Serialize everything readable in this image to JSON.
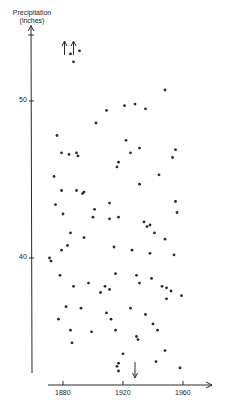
{
  "chart_data": {
    "type": "scatter",
    "title": "",
    "xlabel": "",
    "ylabel": "Precipitation (inches)",
    "ylabel_line1": "Precipitation",
    "ylabel_line2": "(inches)",
    "xlim": [
      1868,
      1988
    ],
    "ylim": [
      32,
      59
    ],
    "x_ticks": [
      1880,
      1920,
      1960
    ],
    "x_tick_labels": [
      "1880",
      "1920",
      "1960"
    ],
    "y_ticks": [
      40,
      50
    ],
    "y_tick_labels": [
      "40",
      "50"
    ],
    "grid": false,
    "legend": null,
    "annotations": [
      {
        "type": "arrow-up",
        "x": 1881,
        "note": "off-scale high value"
      },
      {
        "type": "arrow-up",
        "x": 1887,
        "note": "off-scale high value"
      },
      {
        "type": "arrow-down",
        "x": 1928,
        "note": "off-scale low value"
      }
    ],
    "points": [
      [
        1885,
        53.0
      ],
      [
        1891,
        53.2
      ],
      [
        1887,
        52.5
      ],
      [
        1876,
        47.8
      ],
      [
        1879,
        46.7
      ],
      [
        1884,
        46.6
      ],
      [
        1889,
        46.7
      ],
      [
        1890,
        46.5
      ],
      [
        1874,
        45.2
      ],
      [
        1879,
        44.3
      ],
      [
        1889,
        44.3
      ],
      [
        1893,
        44.1
      ],
      [
        1894,
        44.2
      ],
      [
        1875,
        43.4
      ],
      [
        1880,
        42.8
      ],
      [
        1901,
        43.1
      ],
      [
        1911,
        43.5
      ],
      [
        1900,
        42.6
      ],
      [
        1911,
        42.5
      ],
      [
        1917,
        42.6
      ],
      [
        1885,
        41.6
      ],
      [
        1894,
        41.3
      ],
      [
        1879,
        40.5
      ],
      [
        1883,
        40.8
      ],
      [
        1871,
        40.0
      ],
      [
        1872,
        39.8
      ],
      [
        1878,
        38.9
      ],
      [
        1897,
        38.4
      ],
      [
        1887,
        38.2
      ],
      [
        1908,
        38.2
      ],
      [
        1911,
        38.0
      ],
      [
        1905,
        37.8
      ],
      [
        1882,
        36.9
      ],
      [
        1892,
        36.8
      ],
      [
        1877,
        36.1
      ],
      [
        1885,
        35.4
      ],
      [
        1899,
        35.3
      ],
      [
        1886,
        34.6
      ],
      [
        1909,
        36.5
      ],
      [
        1912,
        36.1
      ],
      [
        1915,
        35.4
      ],
      [
        1902,
        48.6
      ],
      [
        1909,
        49.4
      ],
      [
        1921,
        49.7
      ],
      [
        1928,
        49.8
      ],
      [
        1948,
        50.7
      ],
      [
        1935,
        49.5
      ],
      [
        1922,
        47.5
      ],
      [
        1925,
        46.7
      ],
      [
        1931,
        47.0
      ],
      [
        1955,
        46.9
      ],
      [
        1953,
        46.4
      ],
      [
        1917,
        46.1
      ],
      [
        1916,
        45.8
      ],
      [
        1931,
        44.7
      ],
      [
        1944,
        45.3
      ],
      [
        1934,
        42.3
      ],
      [
        1938,
        42.1
      ],
      [
        1936,
        42.0
      ],
      [
        1941,
        41.6
      ],
      [
        1948,
        41.2
      ],
      [
        1914,
        40.7
      ],
      [
        1926,
        40.5
      ],
      [
        1938,
        40.3
      ],
      [
        1954,
        40.2
      ],
      [
        1956,
        42.9
      ],
      [
        1955,
        43.6
      ],
      [
        1915,
        39.0
      ],
      [
        1929,
        38.9
      ],
      [
        1939,
        38.7
      ],
      [
        1946,
        38.2
      ],
      [
        1949,
        38.1
      ],
      [
        1952,
        37.9
      ],
      [
        1931,
        38.4
      ],
      [
        1949,
        37.4
      ],
      [
        1959,
        37.6
      ],
      [
        1925,
        36.8
      ],
      [
        1935,
        36.4
      ],
      [
        1940,
        35.8
      ],
      [
        1929,
        35.0
      ],
      [
        1930,
        34.8
      ],
      [
        1943,
        35.4
      ],
      [
        1948,
        34.1
      ],
      [
        1920,
        33.9
      ],
      [
        1916,
        33.1
      ],
      [
        1917,
        33.3
      ],
      [
        1917,
        32.8
      ],
      [
        1942,
        33.4
      ],
      [
        1958,
        33.0
      ]
    ]
  },
  "labels": {
    "ylabel_line1": "Precipitation",
    "ylabel_line2": "(inches)",
    "y_tick_50": "50",
    "y_tick_40": "40",
    "x_tick_1880": "1880",
    "x_tick_1920": "1920",
    "x_tick_1960": "1960"
  },
  "colors": {
    "ink": "#2a2a2a",
    "background": "#ffffff"
  }
}
